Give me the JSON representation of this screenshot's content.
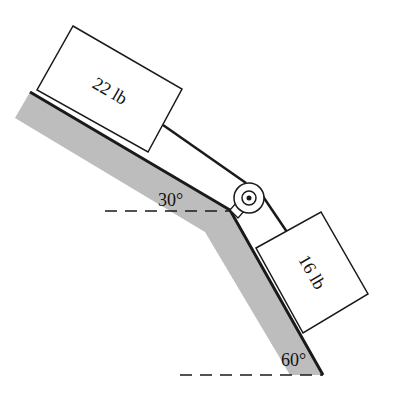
{
  "diagram": {
    "type": "physics-inclined-planes-pulley",
    "blocks": [
      {
        "id": "block-a",
        "label": "22 lb",
        "surface_angle": "30°"
      },
      {
        "id": "block-b",
        "label": "16 lb",
        "surface_angle": "60°"
      }
    ],
    "angles": {
      "upper": "30°",
      "lower": "60°"
    },
    "colors": {
      "ground_fill": "#bdbdbd",
      "stroke": "#1a1a1a",
      "background": "#ffffff"
    }
  }
}
